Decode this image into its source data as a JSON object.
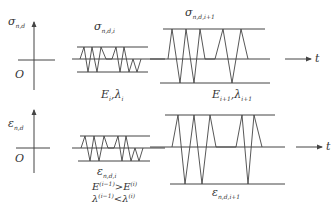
{
  "diagram": {
    "top_panel": {
      "y_axis_label": "σ",
      "y_axis_sub": "n,d",
      "origin_label": "O",
      "time_label": "t",
      "left_block": {
        "label": "σ",
        "label_sub": "n,d,i",
        "param_E": "E",
        "param_E_sub": "i",
        "param_sep": ",",
        "param_L": "λ",
        "param_L_sub": "i"
      },
      "right_block": {
        "label": "σ",
        "label_sub": "n,d,i+1",
        "param_E": "E",
        "param_E_sub": "i+1",
        "param_sep": ",",
        "param_L": "λ",
        "param_L_sub": "i+1"
      }
    },
    "bottom_panel": {
      "y_axis_label": "ε",
      "y_axis_sub": "n,d",
      "origin_label": "O",
      "time_label": "t",
      "left_block": {
        "label": "ε",
        "label_sub": "n,d,i"
      },
      "right_block": {
        "label": "ε",
        "label_sub": "n,d,i+1"
      },
      "relations": {
        "line1_left": "E",
        "line1_left_sup": "(i−1)",
        "line1_op": ">",
        "line1_right": "E",
        "line1_right_sup": "(i)",
        "line2_left": "λ",
        "line2_left_sup": "(i−1)",
        "line2_op": "<",
        "line2_right": "λ",
        "line2_right_sup": "(i)"
      }
    },
    "colors": {
      "stroke": "#444444",
      "text": "#333333",
      "background": "#ffffff"
    }
  }
}
